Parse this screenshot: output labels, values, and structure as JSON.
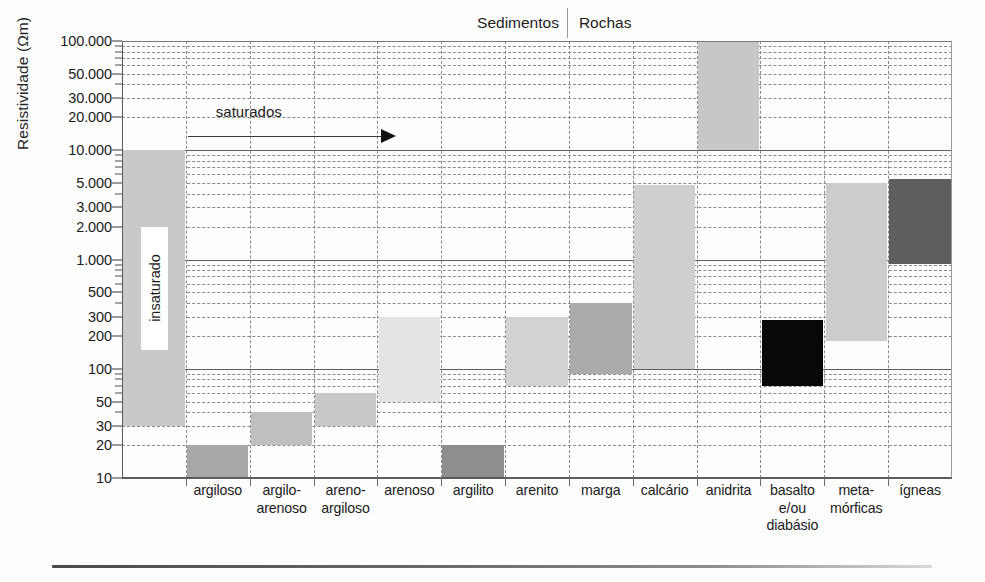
{
  "chart_data": {
    "type": "bar",
    "title": "",
    "groups": [
      "Sedimentos",
      "Rochas"
    ],
    "xlabel": "",
    "ylabel": "Resistividade (Ωm)",
    "yscale": "log",
    "ylim": [
      10,
      100000
    ],
    "grid": true,
    "legend": false,
    "ytick_labels": [
      "100.000",
      "50.000",
      "30.000",
      "20.000",
      "10.000",
      "5.000",
      "3.000",
      "2.000",
      "1.000",
      "500",
      "300",
      "200",
      "100",
      "50",
      "30",
      "20",
      "10"
    ],
    "ytick_values": [
      100000,
      50000,
      30000,
      20000,
      10000,
      5000,
      3000,
      2000,
      1000,
      500,
      300,
      200,
      100,
      50,
      30,
      20,
      10
    ],
    "categories": [
      "insaturado",
      "argiloso",
      "argilo-arenoso",
      "areno-argiloso",
      "arenoso",
      "argilito",
      "arenito",
      "marga",
      "calcário",
      "anidrita",
      "basalto e/ou diabásio",
      "meta-mórficas",
      "ígneas"
    ],
    "category_label_lines": [
      [
        ""
      ],
      [
        "argiloso"
      ],
      [
        "argilo-",
        "arenoso"
      ],
      [
        "areno-",
        "argiloso"
      ],
      [
        "arenoso"
      ],
      [
        "argilito"
      ],
      [
        "arenito"
      ],
      [
        "marga"
      ],
      [
        "calcário"
      ],
      [
        "anidrita"
      ],
      [
        "basalto",
        "e/ou",
        "diabásio"
      ],
      [
        "meta-",
        "mórficas"
      ],
      [
        "ígneas"
      ]
    ],
    "ranges": [
      {
        "name": "insaturado",
        "low": 30,
        "high": 10000,
        "color": "#c9c9c9"
      },
      {
        "name": "argiloso",
        "low": 10,
        "high": 20,
        "color": "#a8a8a8"
      },
      {
        "name": "argilo-arenoso",
        "low": 20,
        "high": 40,
        "color": "#bfbfbf"
      },
      {
        "name": "areno-argiloso",
        "low": 30,
        "high": 60,
        "color": "#c8c8c8"
      },
      {
        "name": "arenoso",
        "low": 50,
        "high": 300,
        "color": "#e4e4e4"
      },
      {
        "name": "argilito",
        "low": 10,
        "high": 20,
        "color": "#8e8e8e"
      },
      {
        "name": "arenito",
        "low": 70,
        "high": 300,
        "color": "#d2d2d2"
      },
      {
        "name": "marga",
        "low": 90,
        "high": 400,
        "color": "#ababab"
      },
      {
        "name": "calcário",
        "low": 100,
        "high": 4800,
        "color": "#cfcfcf"
      },
      {
        "name": "anidrita",
        "low": 10000,
        "high": 100000,
        "color": "#c7c7c7"
      },
      {
        "name": "basalto e/ou diabásio",
        "low": 70,
        "high": 280,
        "color": "#080808"
      },
      {
        "name": "meta-mórficas",
        "low": 180,
        "high": 5000,
        "color": "#cccccc"
      },
      {
        "name": "ígneas",
        "low": 900,
        "high": 5500,
        "color": "#5e5e5e"
      }
    ],
    "annotations": [
      {
        "name": "insaturado",
        "text": "insaturado",
        "orientation": "vertical"
      },
      {
        "name": "saturados",
        "text": "saturados",
        "orientation": "horizontal-arrow-right"
      }
    ]
  },
  "axes": {
    "ylabel": "Resistividade (Ωm)"
  },
  "header": {
    "sediments": "Sedimentos",
    "rocks": "Rochas"
  },
  "annotations": {
    "insaturado": "insaturado",
    "saturados": "saturados"
  }
}
